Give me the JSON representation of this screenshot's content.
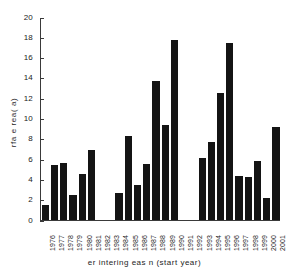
{
  "chart_data": {
    "type": "bar",
    "title": "",
    "xlabel": "er  intering   eas n (start year)",
    "ylabel": "rfa e  rea( a)",
    "categories": [
      "1976",
      "1977",
      "1978",
      "1979",
      "1980",
      "1981",
      "1982",
      "1983",
      "1984",
      "1985",
      "1986",
      "1987",
      "1988",
      "1989",
      "1990",
      "1991",
      "1992",
      "1993",
      "1994",
      "1995",
      "1996",
      "1997",
      "1998",
      "1999",
      "2000",
      "2001"
    ],
    "values": [
      1.5,
      5.4,
      5.65,
      2.45,
      4.55,
      6.95,
      0,
      0,
      2.7,
      8.35,
      3.45,
      5.5,
      13.75,
      9.4,
      17.8,
      0,
      0,
      6.1,
      7.7,
      12.55,
      17.5,
      4.4,
      4.25,
      5.85,
      2.15,
      9.2
    ],
    "ylim": [
      0,
      20
    ],
    "yticks": [
      0,
      2,
      4,
      6,
      8,
      10,
      12,
      14,
      16,
      18,
      20
    ],
    "ytick_labels": [
      "0",
      "2",
      "4",
      "6",
      "8",
      "10",
      "12",
      "14",
      "16",
      "18",
      "20"
    ],
    "grid": false,
    "legend": false,
    "bar_color": "#141414",
    "axis_color": "#3a3a3a",
    "background_color": "#ffffff"
  }
}
